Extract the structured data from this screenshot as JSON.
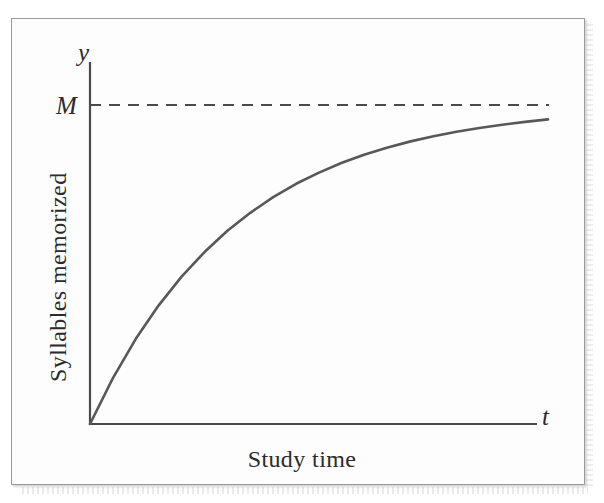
{
  "figure": {
    "kind": "learning-curve-diagram",
    "background_color": "#fdfdfd",
    "ink_color": "#4a4a4a"
  },
  "labels": {
    "y_axis_symbol": "y",
    "x_axis_symbol": "t",
    "asymptote_symbol": "M",
    "y_axis_title": "Syllables memorized",
    "x_axis_title": "Study time"
  },
  "chart_data": {
    "type": "line",
    "title": "",
    "subtitle": "",
    "xlabel": "Study time",
    "ylabel": "Syllables memorized",
    "x_symbol": "t",
    "y_symbol": "y",
    "grid": false,
    "legend": false,
    "legend_position": "none",
    "xlim": [
      0,
      1
    ],
    "ylim": [
      0,
      1.08
    ],
    "xticks": [],
    "yticks": [],
    "ytick_labels": [
      "M"
    ],
    "annotations": [
      {
        "name": "asymptote",
        "label": "M",
        "style": "dashed",
        "orientation": "horizontal",
        "y": 1.0,
        "color": "#4a4a4a"
      }
    ],
    "series": [
      {
        "name": "syllables-memorized",
        "style": "solid",
        "color": "#555555",
        "equation": "y = M(1 - e^(-kt))",
        "k": 3.1,
        "M": 1.0,
        "x": [
          0.0,
          0.05,
          0.1,
          0.15,
          0.2,
          0.25,
          0.3,
          0.35,
          0.4,
          0.45,
          0.5,
          0.55,
          0.6,
          0.65,
          0.7,
          0.75,
          0.8,
          0.85,
          0.9,
          0.95,
          1.0
        ],
        "values": [
          0.0,
          0.144,
          0.267,
          0.372,
          0.462,
          0.539,
          0.606,
          0.662,
          0.711,
          0.753,
          0.788,
          0.819,
          0.845,
          0.867,
          0.886,
          0.902,
          0.916,
          0.928,
          0.938,
          0.947,
          0.955
        ]
      }
    ]
  },
  "geometry": {
    "origin_px": [
      90,
      424
    ],
    "y_axis_top_px": 62,
    "x_axis_right_px": 537,
    "asymptote_y_px": 105,
    "curve_end_px": [
      548,
      105
    ],
    "dash_pattern": "11 8"
  }
}
